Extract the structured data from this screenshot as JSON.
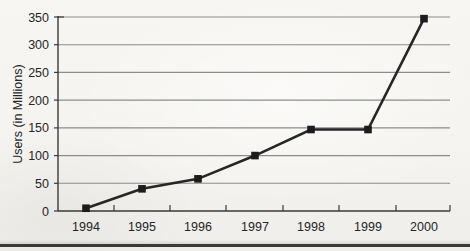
{
  "chart_data": {
    "type": "line",
    "title": "",
    "subtitle": "",
    "xlabel": "",
    "ylabel": "Users (in Millions)",
    "categories": [
      "1994",
      "1995",
      "1996",
      "1997",
      "1998",
      "1999",
      "2000"
    ],
    "values": [
      5,
      40,
      58,
      100,
      147,
      147,
      347
    ],
    "series": [
      {
        "name": "Users",
        "values": [
          5,
          40,
          58,
          100,
          147,
          147,
          347
        ]
      }
    ],
    "ylim": [
      0,
      350
    ],
    "yticks": [
      0,
      50,
      100,
      150,
      200,
      250,
      300,
      350
    ],
    "ytick_labels": [
      "0",
      "50",
      "100",
      "150",
      "200",
      "250",
      "300",
      "350"
    ],
    "grid": "horizontal",
    "legend": "none",
    "marker": "square",
    "colors": {
      "line": "#262626",
      "marker": "#1c1c1c",
      "grid": "#8d8d8d",
      "axis": "#3a3a3a",
      "background": "#f6f5f2",
      "text": "#262626"
    }
  },
  "axes": {
    "y_title": "Users (in Millions)",
    "y_tick_labels": [
      "350",
      "300",
      "250",
      "200",
      "150",
      "100",
      "50",
      "0"
    ],
    "x_tick_labels": [
      "1994",
      "1995",
      "1996",
      "1997",
      "1998",
      "1999",
      "2000"
    ]
  }
}
